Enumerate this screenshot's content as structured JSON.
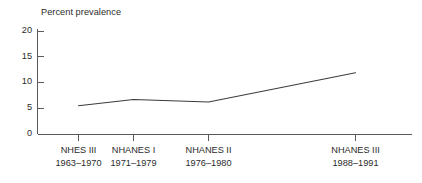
{
  "chart_data": {
    "type": "line",
    "title": "Percent prevalence",
    "xlabel": "",
    "ylabel": "",
    "ylim": [
      0,
      20
    ],
    "yticks": [
      0,
      5,
      10,
      15,
      20
    ],
    "ytick_labels": [
      "0",
      "5",
      "10",
      "15",
      "20"
    ],
    "grid": false,
    "legend": null,
    "categories": [
      "NHES III",
      "NHANES I",
      "NHANES II",
      "NHANES III"
    ],
    "category_periods": [
      "1963–1970",
      "1971–1979",
      "1976–1980",
      "1988–1991"
    ],
    "xtick_labels": [
      {
        "name": "NHES III",
        "period": "1963–1970"
      },
      {
        "name": "NHANES I",
        "period": "1971–1979"
      },
      {
        "name": "NHANES II",
        "period": "1976–1980"
      },
      {
        "name": "NHANES III",
        "period": "1988–1991"
      }
    ],
    "values": [
      5.5,
      6.7,
      6.2,
      11.9
    ],
    "series": [
      {
        "name": "Percent prevalence",
        "values": [
          5.5,
          6.7,
          6.2,
          11.9
        ]
      }
    ],
    "colors": {
      "line": "#3c3c3c",
      "axis": "#5a5a5a",
      "text": "#2b2b2b",
      "background": "#ffffff"
    }
  },
  "geometry": {
    "axis_x": 37,
    "axis_top_y": 29,
    "axis_bottom_y": 134,
    "axis_right_x": 412,
    "tick_x_positions": [
      78,
      133,
      208,
      355
    ],
    "ytick_y_positions": [
      134,
      108.25,
      82.5,
      56.75,
      31
    ],
    "point_pixels": [
      {
        "x": 78,
        "y": 105
      },
      {
        "x": 133,
        "y": 99
      },
      {
        "x": 208,
        "y": 102
      },
      {
        "x": 355,
        "y": 69
      }
    ]
  }
}
